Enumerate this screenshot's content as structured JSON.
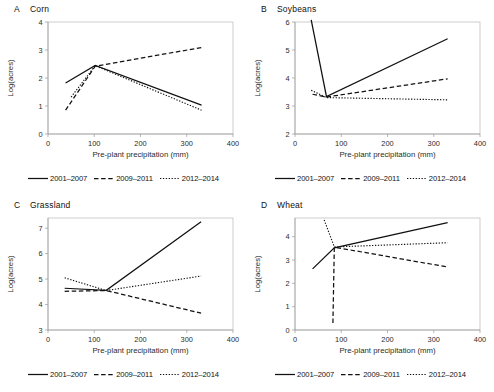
{
  "figure": {
    "axis": {
      "xlabel": "Pre-plant precipitation (mm)",
      "ylabel": "Log(acres)"
    },
    "legend": [
      {
        "label": "2001–2007",
        "style": "solid"
      },
      {
        "label": "2009–2011",
        "style": "dashed"
      },
      {
        "label": "2012–2014",
        "style": "dotted"
      }
    ]
  },
  "chart_data": [
    {
      "type": "line",
      "panel_letter": "A",
      "title": "Corn",
      "xlabel": "Pre-plant precipitation (mm)",
      "ylabel": "Log(acres)",
      "xlim": [
        0,
        400
      ],
      "ylim": [
        0,
        4
      ],
      "xticks": [
        0,
        100,
        200,
        300,
        400
      ],
      "yticks": [
        0,
        1,
        2,
        3,
        4
      ],
      "grid": false,
      "legend_position": "below",
      "series": [
        {
          "name": "2001–2007",
          "style": "solid",
          "points": [
            [
              38,
              1.82
            ],
            [
              102,
              2.45
            ],
            [
              332,
              1.03
            ]
          ]
        },
        {
          "name": "2009–2011",
          "style": "dashed",
          "points": [
            [
              38,
              0.85
            ],
            [
              102,
              2.42
            ],
            [
              332,
              3.09
            ]
          ]
        },
        {
          "name": "2012–2014",
          "style": "dotted",
          "points": [
            [
              50,
              1.32
            ],
            [
              102,
              2.44
            ],
            [
              332,
              0.85
            ]
          ]
        }
      ]
    },
    {
      "type": "line",
      "panel_letter": "B",
      "title": "Soybeans",
      "xlabel": "Pre-plant precipitation (mm)",
      "ylabel": "Log(acres)",
      "xlim": [
        0,
        400
      ],
      "ylim": [
        2,
        6
      ],
      "xticks": [
        0,
        100,
        200,
        300,
        400
      ],
      "yticks": [
        2,
        3,
        4,
        5,
        6
      ],
      "grid": false,
      "legend_position": "below",
      "series": [
        {
          "name": "2001–2007",
          "style": "solid",
          "points": [
            [
              35,
              6.08
            ],
            [
              68,
              3.34
            ],
            [
              330,
              5.4
            ]
          ]
        },
        {
          "name": "2009–2011",
          "style": "dashed",
          "points": [
            [
              38,
              3.42
            ],
            [
              68,
              3.32
            ],
            [
              330,
              3.97
            ]
          ]
        },
        {
          "name": "2012–2014",
          "style": "dotted",
          "points": [
            [
              35,
              3.56
            ],
            [
              68,
              3.3
            ],
            [
              330,
              3.22
            ]
          ]
        }
      ]
    },
    {
      "type": "line",
      "panel_letter": "C",
      "title": "Grassland",
      "xlabel": "Pre-plant precipitation (mm)",
      "ylabel": "Log(acres)",
      "xlim": [
        0,
        400
      ],
      "ylim": [
        3,
        7.4
      ],
      "xticks": [
        0,
        100,
        200,
        300,
        400
      ],
      "yticks": [
        3,
        4,
        5,
        6,
        7
      ],
      "grid": false,
      "legend_position": "below",
      "series": [
        {
          "name": "2001–2007",
          "style": "solid",
          "points": [
            [
              36,
              4.64
            ],
            [
              126,
              4.56
            ],
            [
              331,
              7.25
            ]
          ]
        },
        {
          "name": "2009–2011",
          "style": "dashed",
          "points": [
            [
              36,
              4.52
            ],
            [
              126,
              4.55
            ],
            [
              331,
              3.66
            ]
          ]
        },
        {
          "name": "2012–2014",
          "style": "dotted",
          "points": [
            [
              36,
              5.05
            ],
            [
              126,
              4.55
            ],
            [
              331,
              5.12
            ]
          ]
        }
      ]
    },
    {
      "type": "line",
      "panel_letter": "D",
      "title": "Wheat",
      "xlabel": "Pre-plant precipitation (mm)",
      "ylabel": "Log(acres)",
      "xlim": [
        0,
        400
      ],
      "ylim": [
        0,
        4.8
      ],
      "xticks": [
        0,
        100,
        200,
        300,
        400
      ],
      "yticks": [
        0,
        1,
        2,
        3,
        4
      ],
      "grid": false,
      "legend_position": "below",
      "series": [
        {
          "name": "2001–2007",
          "style": "solid",
          "points": [
            [
              38,
              2.62
            ],
            [
              85,
              3.52
            ],
            [
              330,
              4.6
            ]
          ]
        },
        {
          "name": "2009–2011",
          "style": "dashed",
          "points": [
            [
              82,
              0.3
            ],
            [
              85,
              3.55
            ],
            [
              330,
              2.7
            ]
          ]
        },
        {
          "name": "2012–2014",
          "style": "dotted",
          "points": [
            [
              63,
              4.72
            ],
            [
              85,
              3.56
            ],
            [
              330,
              3.74
            ]
          ]
        }
      ]
    }
  ]
}
